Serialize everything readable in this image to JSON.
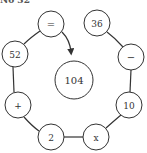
{
  "header": {
    "label": "No 32"
  },
  "puzzle": {
    "center": {
      "value": "104",
      "cx": 74,
      "cy": 80,
      "r": 19
    },
    "nodes": [
      {
        "id": "equals",
        "label": "=",
        "cx": 51,
        "cy": 24
      },
      {
        "id": "n36",
        "label": "36",
        "cx": 97,
        "cy": 23
      },
      {
        "id": "minus",
        "label": "−",
        "cx": 131,
        "cy": 57
      },
      {
        "id": "n10",
        "label": "10",
        "cx": 129,
        "cy": 105
      },
      {
        "id": "times",
        "label": "x",
        "cx": 96,
        "cy": 137
      },
      {
        "id": "n2",
        "label": "2",
        "cx": 51,
        "cy": 137
      },
      {
        "id": "plus",
        "label": "+",
        "cx": 18,
        "cy": 105
      },
      {
        "id": "n52",
        "label": "52",
        "cx": 15,
        "cy": 54
      }
    ],
    "node_radius": 13,
    "stroke_color": "#333333",
    "arrow": {
      "from": "equals",
      "direction": "toward-center"
    }
  }
}
